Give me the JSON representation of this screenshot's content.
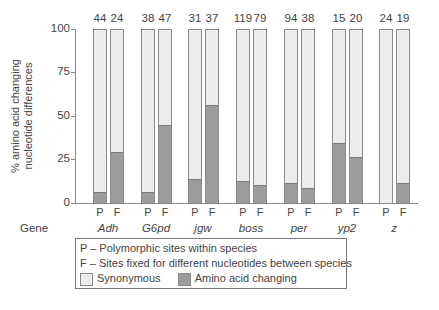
{
  "chart_data": {
    "type": "bar",
    "subtype": "stacked_100_percent_paired",
    "title": "",
    "xlabel": "Gene",
    "ylabel": "% amino acid changing nucleotide differences",
    "ylabel_lines": [
      "% amino acid changing",
      "nucleotide differences"
    ],
    "ylim": [
      0,
      100
    ],
    "yticks": [
      0,
      25,
      50,
      75,
      100
    ],
    "grid": false,
    "categories": [
      "Adh",
      "G6pd",
      "jgw",
      "boss",
      "per",
      "yp2",
      "z"
    ],
    "bar_labels": [
      "P",
      "F"
    ],
    "series": [
      {
        "name": "P - Amino acid changing (%)",
        "values": [
          6,
          6,
          13,
          12,
          11,
          34,
          0
        ]
      },
      {
        "name": "F - Amino acid changing (%)",
        "values": [
          29,
          44,
          56,
          10,
          8,
          26,
          11
        ]
      }
    ],
    "counts": {
      "P": [
        44,
        38,
        31,
        119,
        94,
        15,
        24
      ],
      "F": [
        24,
        47,
        37,
        79,
        38,
        20,
        19
      ]
    },
    "legend": {
      "position": "bottom",
      "entries": [
        "P – Polymorphic sites within species",
        "F – Sites fixed for different nucleotides between species",
        "Synonymous",
        "Amino acid changing"
      ]
    },
    "colors": {
      "synonymous": "#ececec",
      "amino_acid_changing": "#9c9c9c",
      "border": "#8a8a8a"
    }
  },
  "axis": {
    "ylabel_line1": "% amino acid changing",
    "ylabel_line2": "nucleotide differences",
    "ticks": [
      "0",
      "25",
      "50",
      "75",
      "100"
    ],
    "gene_header": "Gene"
  },
  "groups": [
    {
      "gene": "Adh",
      "p_label": "P",
      "f_label": "F",
      "p_count": "44",
      "f_count": "24",
      "p_value": 6,
      "f_value": 29
    },
    {
      "gene": "G6pd",
      "p_label": "P",
      "f_label": "F",
      "p_count": "38",
      "f_count": "47",
      "p_value": 6,
      "f_value": 44
    },
    {
      "gene": "jgw",
      "p_label": "P",
      "f_label": "F",
      "p_count": "31",
      "f_count": "37",
      "p_value": 13,
      "f_value": 56
    },
    {
      "gene": "boss",
      "p_label": "P",
      "f_label": "F",
      "p_count": "119",
      "f_count": "79",
      "p_value": 12,
      "f_value": 10
    },
    {
      "gene": "per",
      "p_label": "P",
      "f_label": "F",
      "p_count": "94",
      "f_count": "38",
      "p_value": 11,
      "f_value": 8
    },
    {
      "gene": "yp2",
      "p_label": "P",
      "f_label": "F",
      "p_count": "15",
      "f_count": "20",
      "p_value": 34,
      "f_value": 26
    },
    {
      "gene": "z",
      "p_label": "P",
      "f_label": "F",
      "p_count": "24",
      "f_count": "19",
      "p_value": 0,
      "f_value": 11
    }
  ],
  "legend": {
    "p_line": "P – Polymorphic sites within species",
    "f_line": "F – Sites fixed for different nucleotides between species",
    "synonymous": "Synonymous",
    "amino_acid_changing": "Amino acid changing"
  }
}
